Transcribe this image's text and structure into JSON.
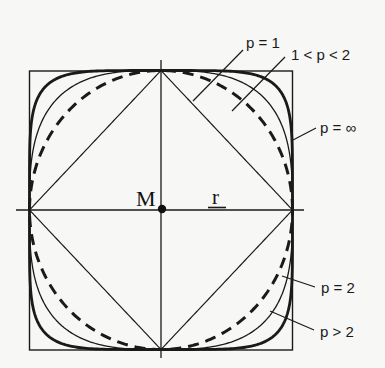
{
  "figure": {
    "center_label": "M",
    "radius_label": "r",
    "labels": {
      "p1": "p = 1",
      "p1to2": "1 < p < 2",
      "pinf": "p = ∞",
      "p2": "p = 2",
      "pgt2": "p > 2"
    },
    "colors": {
      "ink": "#1a1a1a",
      "background": "#f7f7f5"
    },
    "geometry": {
      "center": [
        161,
        210
      ],
      "half_width": 131.5,
      "half_height": 139.5,
      "curves": [
        {
          "name": "diamond",
          "p": 1,
          "style": "thin"
        },
        {
          "name": "circle",
          "p": 2,
          "style": "dashed"
        },
        {
          "name": "intermediate",
          "p": 3,
          "style": "thin"
        },
        {
          "name": "outer",
          "p": 5.5,
          "style": "thick"
        },
        {
          "name": "square",
          "p": "inf",
          "style": "thin"
        }
      ]
    }
  }
}
